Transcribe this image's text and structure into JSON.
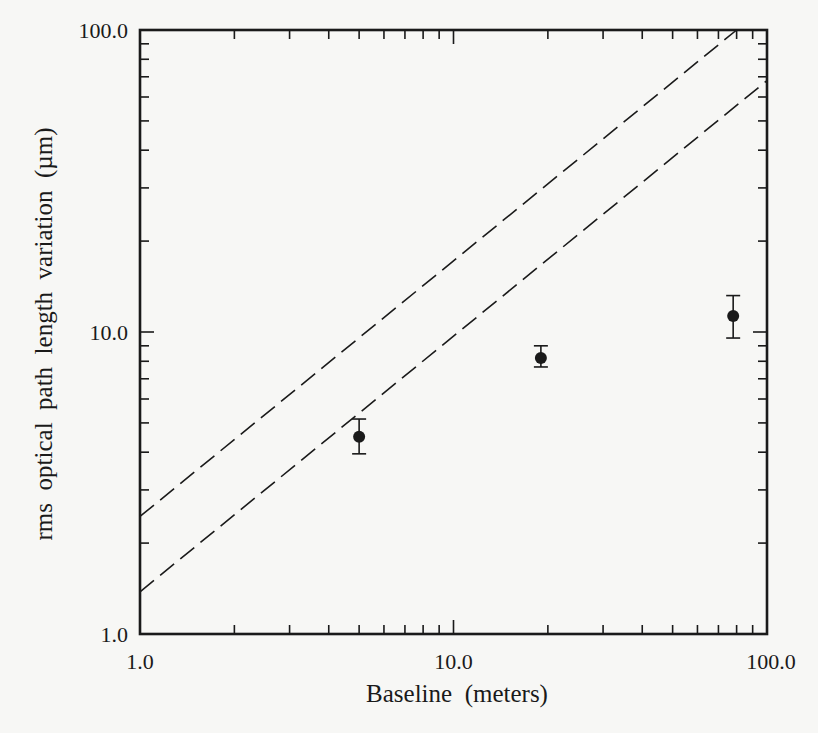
{
  "chart_data": {
    "type": "scatter",
    "title": "",
    "xlabel": "Baseline  (meters)",
    "ylabel": "rms  optical  path  length  variation  (µm)",
    "xscale": "log",
    "yscale": "log",
    "xlim": [
      1.0,
      100.0
    ],
    "ylim": [
      1.0,
      100.0
    ],
    "x_tick_labels": [
      "1.0",
      "10.0",
      "100.0"
    ],
    "y_tick_labels": [
      "1.0",
      "10.0",
      "100.0"
    ],
    "x_ticks": [
      1,
      10,
      100
    ],
    "y_ticks": [
      1,
      10,
      100
    ],
    "grid": false,
    "legend": null,
    "series": [
      {
        "name": "measurements",
        "marker": "filled-circle",
        "points": [
          {
            "x": 5.0,
            "y": 4.5,
            "y_err_low": 3.95,
            "y_err_high": 5.15
          },
          {
            "x": 19.0,
            "y": 8.2,
            "y_err_low": 7.66,
            "y_err_high": 9.0
          },
          {
            "x": 78.0,
            "y": 11.3,
            "y_err_low": 9.55,
            "y_err_high": 13.2
          }
        ]
      }
    ],
    "reference_lines": [
      {
        "name": "upper-dashed-line",
        "style": "dashed",
        "x": [
          1.0,
          80.0
        ],
        "y": [
          2.45,
          100.0
        ]
      },
      {
        "name": "lower-dashed-line",
        "style": "dashed",
        "x": [
          1.0,
          100.0
        ],
        "y": [
          1.38,
          68.0
        ]
      }
    ],
    "colors": {
      "ink": "#1a1a1a",
      "background": "#f7f7f5"
    }
  }
}
